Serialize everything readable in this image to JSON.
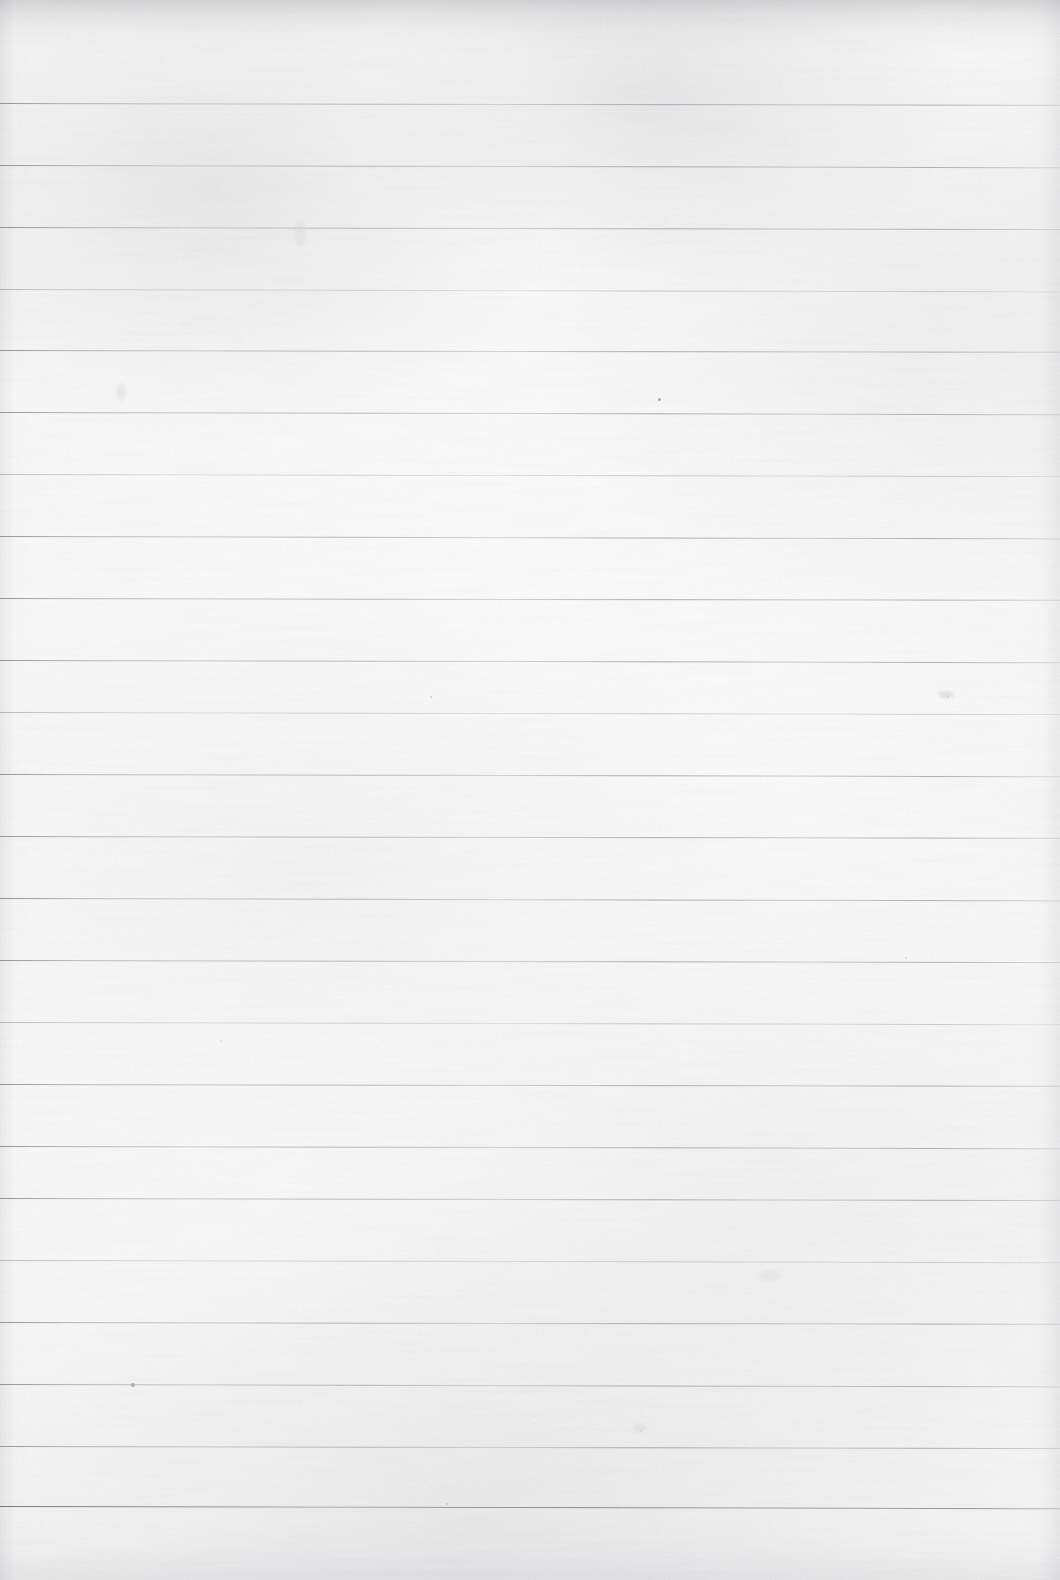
{
  "page": {
    "kind": "scanned-blank-lined-notebook-page",
    "width": 1060,
    "height": 1580,
    "paper_color": "#fafafa",
    "paper_highlight_color": "#fdfdfd",
    "paper_shadow_color": "#f2f2f4",
    "has_visible_text": false,
    "has_handwriting": false,
    "has_header_text": false,
    "has_footer_text": false,
    "has_page_number": false,
    "has_margin_rule": false,
    "orientation": "portrait"
  },
  "ruling": {
    "line_color": "#8e9098",
    "line_count": 23,
    "first_line_y": 103,
    "line_spacing": 62,
    "line_thickness": 1,
    "left_inset": 0,
    "right_inset": 0,
    "full_bleed": true,
    "tilt_degrees": 0.12,
    "top_margin": 103,
    "bottom_margin": 74,
    "lines": [
      {
        "index": 1,
        "y": 103,
        "weight": "normal",
        "tilt": 0.1
      },
      {
        "index": 2,
        "y": 165,
        "weight": "normal",
        "tilt": 0.12
      },
      {
        "index": 3,
        "y": 227,
        "weight": "normal",
        "tilt": 0.11
      },
      {
        "index": 4,
        "y": 289,
        "weight": "faint",
        "tilt": 0.13
      },
      {
        "index": 5,
        "y": 350,
        "weight": "normal",
        "tilt": 0.1
      },
      {
        "index": 6,
        "y": 412,
        "weight": "normal",
        "tilt": 0.12
      },
      {
        "index": 7,
        "y": 474,
        "weight": "faint",
        "tilt": 0.11
      },
      {
        "index": 8,
        "y": 536,
        "weight": "normal",
        "tilt": 0.13
      },
      {
        "index": 9,
        "y": 598,
        "weight": "normal",
        "tilt": 0.1
      },
      {
        "index": 10,
        "y": 660,
        "weight": "normal",
        "tilt": 0.12
      },
      {
        "index": 11,
        "y": 712,
        "weight": "faint",
        "tilt": 0.11
      },
      {
        "index": 12,
        "y": 774,
        "weight": "normal",
        "tilt": 0.12
      },
      {
        "index": 13,
        "y": 836,
        "weight": "normal",
        "tilt": 0.1
      },
      {
        "index": 14,
        "y": 898,
        "weight": "normal",
        "tilt": 0.13
      },
      {
        "index": 15,
        "y": 960,
        "weight": "normal",
        "tilt": 0.11
      },
      {
        "index": 16,
        "y": 1022,
        "weight": "faint",
        "tilt": 0.12
      },
      {
        "index": 17,
        "y": 1084,
        "weight": "normal",
        "tilt": 0.1
      },
      {
        "index": 18,
        "y": 1146,
        "weight": "normal",
        "tilt": 0.12
      },
      {
        "index": 19,
        "y": 1198,
        "weight": "normal",
        "tilt": 0.11
      },
      {
        "index": 20,
        "y": 1260,
        "weight": "faint",
        "tilt": 0.12
      },
      {
        "index": 21,
        "y": 1322,
        "weight": "normal",
        "tilt": 0.1
      },
      {
        "index": 22,
        "y": 1384,
        "weight": "normal",
        "tilt": 0.13
      },
      {
        "index": 23,
        "y": 1446,
        "weight": "normal",
        "tilt": 0.11
      },
      {
        "index": 24,
        "y": 1506,
        "weight": "strong",
        "tilt": 0.12
      }
    ]
  },
  "artifacts": {
    "scan_edge_top": true,
    "scan_edge_bottom": true,
    "vignette_left": true,
    "vignette_right": true,
    "grain": true,
    "specks": [
      {
        "x": 659,
        "y": 399,
        "size": 3.0,
        "color": "#9a9aa2",
        "opacity": 0.8
      },
      {
        "x": 133,
        "y": 1385,
        "size": 3.2,
        "color": "#a0a0a8",
        "opacity": 0.72
      },
      {
        "x": 431,
        "y": 697,
        "size": 2.4,
        "color": "#b0b0b8",
        "opacity": 0.55
      },
      {
        "x": 948,
        "y": 697,
        "size": 2.6,
        "color": "#b4b4bc",
        "opacity": 0.45
      },
      {
        "x": 447,
        "y": 1504,
        "size": 2.2,
        "color": "#adadb5",
        "opacity": 0.5
      },
      {
        "x": 906,
        "y": 958,
        "size": 2.0,
        "color": "#b6b6be",
        "opacity": 0.42
      },
      {
        "x": 641,
        "y": 1431,
        "size": 2.0,
        "color": "#b8b8c0",
        "opacity": 0.4
      },
      {
        "x": 221,
        "y": 1041,
        "size": 1.8,
        "color": "#bcbcc4",
        "opacity": 0.38
      }
    ],
    "smudges": [
      {
        "x": 946,
        "y": 694,
        "w": 16,
        "h": 7,
        "color": "#d8d8dc",
        "opacity": 0.6
      },
      {
        "x": 640,
        "y": 1428,
        "w": 14,
        "h": 8,
        "color": "#dcdce0",
        "opacity": 0.52
      },
      {
        "x": 121,
        "y": 392,
        "w": 10,
        "h": 18,
        "color": "#dedee2",
        "opacity": 0.48
      },
      {
        "x": 300,
        "y": 234,
        "w": 12,
        "h": 26,
        "color": "#e0e0e4",
        "opacity": 0.42
      },
      {
        "x": 770,
        "y": 1276,
        "w": 22,
        "h": 12,
        "color": "#e2e2e6",
        "opacity": 0.4
      }
    ]
  }
}
